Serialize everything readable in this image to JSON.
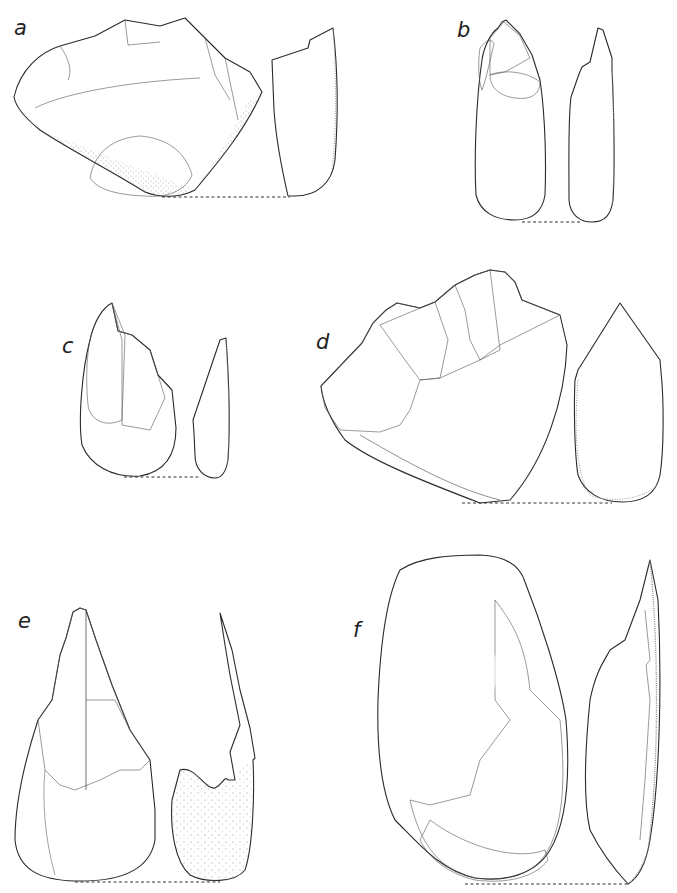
{
  "figure": {
    "panels": [
      {
        "label": "a",
        "view": "face",
        "has_section": true
      },
      {
        "label": "b",
        "view": "face",
        "has_section": true
      },
      {
        "label": "c",
        "view": "face",
        "has_section": true
      },
      {
        "label": "d",
        "view": "face",
        "has_section": true
      },
      {
        "label": "e",
        "view": "face",
        "has_section": true
      },
      {
        "label": "f",
        "view": "face",
        "has_section": true
      }
    ]
  },
  "colors": {
    "ink": "#2a2a2a",
    "paper": "#ffffff"
  }
}
